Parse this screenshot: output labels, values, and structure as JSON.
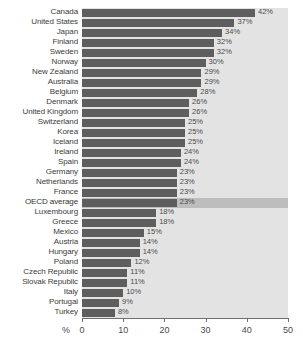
{
  "chart_data": {
    "type": "bar",
    "orientation": "horizontal",
    "title": "",
    "xlabel": "%",
    "ylabel": "",
    "xlim": [
      0,
      50
    ],
    "xticks": [
      0,
      10,
      20,
      30,
      40,
      50
    ],
    "xtick_labels": [
      "0",
      "10",
      "20",
      "30",
      "40",
      "50"
    ],
    "grid": true,
    "grid_axis": "x",
    "legend": false,
    "value_label_suffix": "%",
    "highlight_category": "OECD average",
    "categories": [
      "Canada",
      "United States",
      "Japan",
      "Finland",
      "Sweden",
      "Norway",
      "New Zealand",
      "Australia",
      "Belgium",
      "Denmark",
      "United Kingdom",
      "Switzerland",
      "Korea",
      "Iceland",
      "Ireland",
      "Spain",
      "Germany",
      "Netherlands",
      "France",
      "OECD average",
      "Luxembourg",
      "Greece",
      "Mexico",
      "Austria",
      "Hungary",
      "Poland",
      "Czech Republic",
      "Slovak Republic",
      "Italy",
      "Portugal",
      "Turkey"
    ],
    "values": [
      42,
      37,
      34,
      32,
      32,
      30,
      29,
      29,
      28,
      26,
      26,
      25,
      25,
      25,
      24,
      24,
      23,
      23,
      23,
      23,
      18,
      18,
      15,
      14,
      14,
      12,
      11,
      11,
      10,
      9,
      8
    ],
    "value_labels": [
      "42%",
      "37%",
      "34%",
      "32%",
      "32%",
      "30%",
      "29%",
      "29%",
      "28%",
      "26%",
      "26%",
      "25%",
      "25%",
      "25%",
      "24%",
      "24%",
      "23%",
      "23%",
      "23%",
      "23%",
      "18%",
      "18%",
      "15%",
      "14%",
      "14%",
      "12%",
      "11%",
      "11%",
      "10%",
      "9%",
      "8%"
    ],
    "colors": {
      "bar": "#5e5e5e",
      "plot_background": "#e3e3e3",
      "highlight_band": "#bdbdbd",
      "gridline": "#ffffff",
      "axis": "#6f6f6f",
      "label_text": "#3c3c3c",
      "value_text": "#4a4a4a"
    }
  }
}
